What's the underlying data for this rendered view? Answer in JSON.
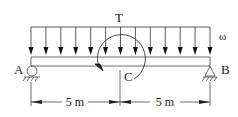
{
  "labels": {
    "torque": "T",
    "load": "ω",
    "support_left": "A",
    "support_right": "B",
    "midpoint": "C",
    "dim_left": "5 m",
    "dim_right": "5 m"
  },
  "geometry": {
    "beam_x_start": 31,
    "beam_x_end": 210,
    "load_arrow_count": 13,
    "span_left_m": 5,
    "span_right_m": 5
  },
  "colors": {
    "stroke": "#222222",
    "background": "#ffffff"
  }
}
